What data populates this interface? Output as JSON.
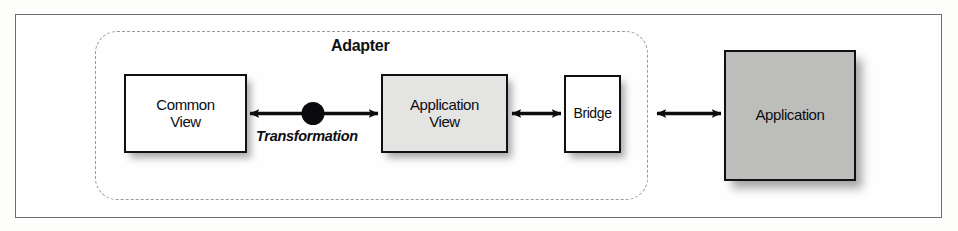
{
  "figure": {
    "background_color": "#fdfdfc",
    "frame_color": "#6e6e72"
  },
  "diagram": {
    "group": {
      "name": "adapter-group",
      "label": "Adapter",
      "border_style": "dashed",
      "border_color": "#9a9a9e"
    },
    "nodes": [
      {
        "id": "common-view",
        "label": "Common\nView",
        "fill": "#fefefe",
        "border": "#101014",
        "inside_group": true
      },
      {
        "id": "application-view",
        "label": "Application\nView",
        "fill": "#e4e4e2",
        "border": "#101014",
        "inside_group": true
      },
      {
        "id": "bridge",
        "label": "Bridge",
        "fill": "#fefefe",
        "border": "#101014",
        "inside_group": true
      },
      {
        "id": "application",
        "label": "Application",
        "fill": "#bdbdbb",
        "border": "#101014",
        "inside_group": false
      }
    ],
    "connectors": [
      {
        "id": "common-view-to-application-view",
        "from": "common-view",
        "to": "application-view",
        "style": "double-headed-arrow",
        "midpoint_marker": "filled-circle",
        "label": "Transformation",
        "label_style": "bold-italic"
      },
      {
        "id": "application-view-to-bridge",
        "from": "application-view",
        "to": "bridge",
        "style": "double-headed-arrow",
        "midpoint_marker": "none",
        "label": ""
      },
      {
        "id": "bridge-to-application",
        "from": "bridge",
        "to": "application",
        "style": "double-headed-arrow",
        "midpoint_marker": "none",
        "label": ""
      }
    ]
  }
}
